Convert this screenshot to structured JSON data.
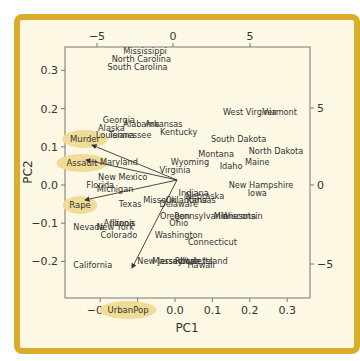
{
  "chart_data": {
    "type": "scatter",
    "title": "",
    "subtitle": "PCA biplot of US Arrests",
    "xlabel": "PC1",
    "ylabel": "PC2",
    "xlim": [
      -0.25,
      0.35
    ],
    "ylim": [
      -0.25,
      0.35
    ],
    "x_ticks": [
      "-0.2",
      "-0.1",
      "0.0",
      "0.1",
      "0.2",
      "0.3"
    ],
    "y_ticks": [
      "0.3",
      "0.2",
      "0.1",
      "0.0",
      "-0.1",
      "-0.2"
    ],
    "top_ticks": [
      "-5",
      "0",
      "5"
    ],
    "right_ticks": [
      "5",
      "0",
      "-5"
    ],
    "grid": false,
    "states": [
      {
        "name": "Mississippi",
        "x": -0.08,
        "y": 0.35
      },
      {
        "name": "North Carolina",
        "x": -0.09,
        "y": 0.33
      },
      {
        "name": "South Carolina",
        "x": -0.1,
        "y": 0.31
      },
      {
        "name": "Georgia",
        "x": -0.15,
        "y": 0.17
      },
      {
        "name": "Alaska",
        "x": -0.17,
        "y": 0.15
      },
      {
        "name": "Alabama",
        "x": -0.09,
        "y": 0.16
      },
      {
        "name": "Arkansas",
        "x": -0.03,
        "y": 0.16
      },
      {
        "name": "Louisiana",
        "x": -0.16,
        "y": 0.13
      },
      {
        "name": "Tennessee",
        "x": -0.12,
        "y": 0.13
      },
      {
        "name": "Kentucky",
        "x": 0.01,
        "y": 0.14
      },
      {
        "name": "West Virginia",
        "x": 0.2,
        "y": 0.19
      },
      {
        "name": "Vermont",
        "x": 0.28,
        "y": 0.19
      },
      {
        "name": "South Dakota",
        "x": 0.17,
        "y": 0.12
      },
      {
        "name": "Montana",
        "x": 0.11,
        "y": 0.08
      },
      {
        "name": "North Dakota",
        "x": 0.27,
        "y": 0.09
      },
      {
        "name": "Maryland",
        "x": -0.15,
        "y": 0.06
      },
      {
        "name": "Wyoming",
        "x": 0.04,
        "y": 0.06
      },
      {
        "name": "Virginia",
        "x": 0.0,
        "y": 0.04
      },
      {
        "name": "Idaho",
        "x": 0.15,
        "y": 0.05
      },
      {
        "name": "Maine",
        "x": 0.22,
        "y": 0.06
      },
      {
        "name": "New Mexico",
        "x": -0.14,
        "y": 0.02
      },
      {
        "name": "Florida",
        "x": -0.2,
        "y": 0.0
      },
      {
        "name": "New Hampshire",
        "x": 0.23,
        "y": 0.0
      },
      {
        "name": "Michigan",
        "x": -0.16,
        "y": -0.01
      },
      {
        "name": "Iowa",
        "x": 0.22,
        "y": -0.02
      },
      {
        "name": "Indiana",
        "x": 0.05,
        "y": -0.02
      },
      {
        "name": "Nebraska",
        "x": 0.08,
        "y": -0.03
      },
      {
        "name": "Missouri",
        "x": -0.04,
        "y": -0.04
      },
      {
        "name": "Oklahoma",
        "x": 0.03,
        "y": -0.04
      },
      {
        "name": "Kansas",
        "x": 0.07,
        "y": -0.04
      },
      {
        "name": "Delaware",
        "x": 0.01,
        "y": -0.05
      },
      {
        "name": "Texas",
        "x": -0.12,
        "y": -0.05
      },
      {
        "name": "Oregon",
        "x": 0.0,
        "y": -0.08
      },
      {
        "name": "Pennsylvania",
        "x": 0.07,
        "y": -0.08
      },
      {
        "name": "Minnesota",
        "x": 0.16,
        "y": -0.08
      },
      {
        "name": "Wisconsin",
        "x": 0.18,
        "y": -0.08
      },
      {
        "name": "Illinois",
        "x": -0.14,
        "y": -0.1
      },
      {
        "name": "Arizona",
        "x": -0.15,
        "y": -0.1
      },
      {
        "name": "Nevada",
        "x": -0.23,
        "y": -0.11
      },
      {
        "name": "New York",
        "x": -0.16,
        "y": -0.11
      },
      {
        "name": "Ohio",
        "x": 0.01,
        "y": -0.1
      },
      {
        "name": "Colorado",
        "x": -0.15,
        "y": -0.13
      },
      {
        "name": "Washington",
        "x": 0.01,
        "y": -0.13
      },
      {
        "name": "Connecticut",
        "x": 0.1,
        "y": -0.15
      },
      {
        "name": "New Jersey",
        "x": -0.04,
        "y": -0.2
      },
      {
        "name": "Massachusetts",
        "x": 0.02,
        "y": -0.2
      },
      {
        "name": "Utah",
        "x": 0.04,
        "y": -0.2
      },
      {
        "name": "Rhode Island",
        "x": 0.07,
        "y": -0.2
      },
      {
        "name": "Hawaii",
        "x": 0.07,
        "y": -0.21
      },
      {
        "name": "California",
        "x": -0.22,
        "y": -0.21
      }
    ],
    "loadings": [
      {
        "name": "Murder",
        "x": -0.21,
        "y": 0.12
      },
      {
        "name": "Assault",
        "x": -0.22,
        "y": 0.06
      },
      {
        "name": "Rape",
        "x": -0.2,
        "y": -0.03
      },
      {
        "name": "UrbanPop",
        "x": -0.11,
        "y": -0.21
      }
    ],
    "colors": {
      "frame": "#d9ae2c",
      "background": "#fdf8e4",
      "highlight": "#f0dc96",
      "text": "#333333"
    }
  }
}
